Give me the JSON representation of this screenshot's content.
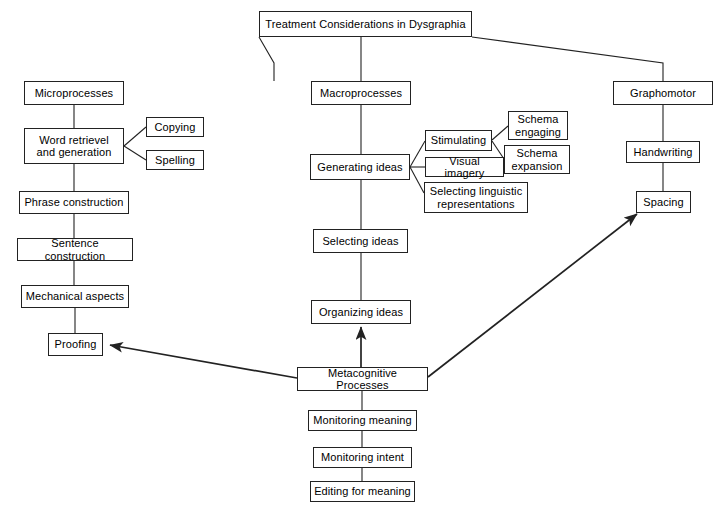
{
  "diagram": {
    "title": "Treatment Considerations in Dysgraphia",
    "nodes": [
      {
        "id": "title",
        "label": "Treatment Considerations in Dysgraphia",
        "x": 259,
        "y": 11,
        "w": 213,
        "h": 26
      },
      {
        "id": "micro",
        "label": "Microprocesses",
        "x": 24,
        "y": 81,
        "w": 100,
        "h": 24
      },
      {
        "id": "word",
        "label": "Word retrievel\nand generation",
        "x": 24,
        "y": 128,
        "w": 100,
        "h": 36
      },
      {
        "id": "copying",
        "label": "Copying",
        "x": 146,
        "y": 117,
        "w": 58,
        "h": 20
      },
      {
        "id": "spelling",
        "label": "Spelling",
        "x": 146,
        "y": 150,
        "w": 58,
        "h": 20
      },
      {
        "id": "phrase",
        "label": "Phrase construction",
        "x": 19,
        "y": 191,
        "w": 110,
        "h": 23
      },
      {
        "id": "sentence",
        "label": "Sentence construction",
        "x": 17,
        "y": 238,
        "w": 116,
        "h": 23
      },
      {
        "id": "mechanical",
        "label": "Mechanical aspects",
        "x": 21,
        "y": 285,
        "w": 108,
        "h": 23
      },
      {
        "id": "proofing",
        "label": "Proofing",
        "x": 48,
        "y": 333,
        "w": 55,
        "h": 23
      },
      {
        "id": "macro",
        "label": "Macroprocesses",
        "x": 311,
        "y": 81,
        "w": 100,
        "h": 24
      },
      {
        "id": "generating",
        "label": "Generating ideas",
        "x": 310,
        "y": 154,
        "w": 100,
        "h": 26
      },
      {
        "id": "stimulating",
        "label": "Stimulating",
        "x": 425,
        "y": 130,
        "w": 67,
        "h": 21
      },
      {
        "id": "visual",
        "label": "Visual imagery",
        "x": 425,
        "y": 157,
        "w": 79,
        "h": 20
      },
      {
        "id": "selecting_ling",
        "label": "Selecting linguistic\nrepresentations",
        "x": 424,
        "y": 182,
        "w": 104,
        "h": 31
      },
      {
        "id": "schema_eng",
        "label": "Schema\nengaging",
        "x": 508,
        "y": 111,
        "w": 60,
        "h": 29
      },
      {
        "id": "schema_exp",
        "label": "Schema\nexpansion",
        "x": 504,
        "y": 145,
        "w": 66,
        "h": 29
      },
      {
        "id": "selecting",
        "label": "Selecting ideas",
        "x": 313,
        "y": 229,
        "w": 95,
        "h": 24
      },
      {
        "id": "organizing",
        "label": "Organizing ideas",
        "x": 311,
        "y": 300,
        "w": 100,
        "h": 24
      },
      {
        "id": "grapho",
        "label": "Graphomotor",
        "x": 613,
        "y": 81,
        "w": 100,
        "h": 24
      },
      {
        "id": "handwriting",
        "label": "Handwriting",
        "x": 626,
        "y": 141,
        "w": 74,
        "h": 22
      },
      {
        "id": "spacing",
        "label": "Spacing",
        "x": 636,
        "y": 191,
        "w": 55,
        "h": 22
      },
      {
        "id": "meta",
        "label": "Metacognitive Processes",
        "x": 297,
        "y": 367,
        "w": 131,
        "h": 24
      },
      {
        "id": "mon_meaning",
        "label": "Monitoring meaning",
        "x": 308,
        "y": 410,
        "w": 109,
        "h": 21
      },
      {
        "id": "mon_intent",
        "label": "Monitoring intent",
        "x": 313,
        "y": 447,
        "w": 99,
        "h": 21
      },
      {
        "id": "edit_meaning",
        "label": "Editing for meaning",
        "x": 310,
        "y": 481,
        "w": 105,
        "h": 21
      }
    ],
    "edges": [
      {
        "id": "title-to-micro",
        "type": "polyline",
        "points": "259,37 274,63 274,81",
        "arrow": false
      },
      {
        "id": "title-to-macro",
        "type": "polyline",
        "points": "361,37 361,81",
        "arrow": false
      },
      {
        "id": "title-to-grapho",
        "type": "polyline",
        "points": "472,37 663,63 663,81",
        "arrow": false
      },
      {
        "id": "micro-to-word",
        "type": "polyline",
        "points": "74,105 74,128",
        "arrow": false
      },
      {
        "id": "word-to-copying",
        "type": "polyline",
        "points": "124,146 146,127",
        "arrow": false
      },
      {
        "id": "word-to-spelling",
        "type": "polyline",
        "points": "124,146 146,160",
        "arrow": false
      },
      {
        "id": "word-to-phrase",
        "type": "polyline",
        "points": "74,164 74,191",
        "arrow": false
      },
      {
        "id": "phrase-to-sentence",
        "type": "polyline",
        "points": "74,214 74,238",
        "arrow": false
      },
      {
        "id": "sentence-to-mechanical",
        "type": "polyline",
        "points": "74,261 74,285",
        "arrow": false
      },
      {
        "id": "mechanical-to-proofing",
        "type": "polyline",
        "points": "75,308 75,333",
        "arrow": false
      },
      {
        "id": "macro-to-generating",
        "type": "polyline",
        "points": "361,105 361,154",
        "arrow": false
      },
      {
        "id": "gen-to-stimulating",
        "type": "polyline",
        "points": "410,167 425,141",
        "arrow": false
      },
      {
        "id": "gen-to-visual",
        "type": "polyline",
        "points": "410,167 425,167",
        "arrow": false
      },
      {
        "id": "gen-to-selecting-ling",
        "type": "polyline",
        "points": "410,167 424,193",
        "arrow": false
      },
      {
        "id": "stim-to-schema-eng",
        "type": "polyline",
        "points": "492,140 508,126",
        "arrow": false
      },
      {
        "id": "stim-to-schema-exp",
        "type": "polyline",
        "points": "492,141 504,159",
        "arrow": false
      },
      {
        "id": "generating-to-selecting",
        "type": "polyline",
        "points": "361,180 361,229",
        "arrow": false
      },
      {
        "id": "selecting-to-organizing",
        "type": "polyline",
        "points": "361,253 361,300",
        "arrow": false
      },
      {
        "id": "grapho-to-handwriting",
        "type": "polyline",
        "points": "663,105 663,141",
        "arrow": false
      },
      {
        "id": "handwriting-to-spacing",
        "type": "polyline",
        "points": "663,163 663,191",
        "arrow": false
      },
      {
        "id": "meta-to-mon-meaning",
        "type": "polyline",
        "points": "362,391 362,410",
        "arrow": false
      },
      {
        "id": "mon-meaning-to-intent",
        "type": "polyline",
        "points": "362,431 362,447",
        "arrow": false
      },
      {
        "id": "mon-intent-to-editing",
        "type": "polyline",
        "points": "362,468 362,481",
        "arrow": false
      },
      {
        "id": "meta-to-proofing",
        "type": "arrow",
        "points": "297,378 110,345",
        "arrow": true
      },
      {
        "id": "meta-to-organizing",
        "type": "arrow",
        "points": "361,367 361,327",
        "arrow": true
      },
      {
        "id": "meta-to-spacing",
        "type": "arrow",
        "points": "428,377 637,214",
        "arrow": true
      }
    ],
    "style": {
      "stroke": "#222222",
      "background": "#ffffff",
      "text": "#000000"
    }
  }
}
